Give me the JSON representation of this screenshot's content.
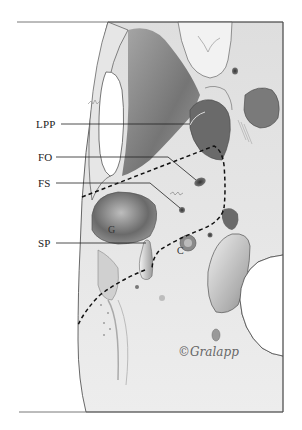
{
  "figure": {
    "labels": [
      {
        "id": "lpp",
        "text": "LPP",
        "x": 35,
        "y": 119
      },
      {
        "id": "fo",
        "text": "FO",
        "x": 38,
        "y": 152
      },
      {
        "id": "fs",
        "text": "FS",
        "x": 38,
        "y": 176
      },
      {
        "id": "sp",
        "text": "SP",
        "x": 38,
        "y": 238
      }
    ],
    "inner_labels": [
      {
        "id": "g",
        "text": "G",
        "x": 108,
        "y": 225
      },
      {
        "id": "c",
        "text": "C",
        "x": 176,
        "y": 247
      }
    ],
    "signature": "©Gralapp",
    "colors": {
      "frame": "#555555",
      "bone_light": "#ececec",
      "bone_mid": "#b8b8b8",
      "bone_dark": "#6e6e6e",
      "dashed_line": "#111111"
    }
  }
}
